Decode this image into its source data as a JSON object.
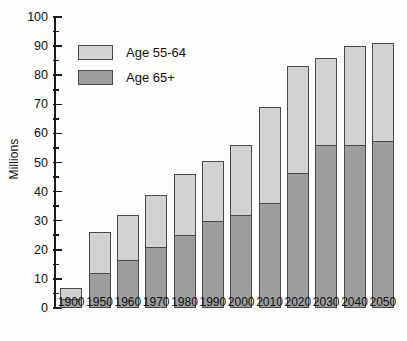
{
  "chart_data": {
    "type": "bar",
    "subtype": "stacked-bar",
    "title": "",
    "xlabel": "",
    "ylabel": "Millions",
    "ylim": [
      0,
      100
    ],
    "ytick_step": 10,
    "yminor_step": 5,
    "grid": false,
    "legend_position": "upper-left",
    "categories": [
      "1900",
      "1950",
      "1960",
      "1970",
      "1980",
      "1990",
      "2000",
      "2010",
      "2020",
      "2030",
      "2040",
      "2050"
    ],
    "ytick_labels": [
      "0",
      "10",
      "20",
      "30",
      "40",
      "50",
      "60",
      "70",
      "80",
      "90",
      "100"
    ],
    "series": [
      {
        "name": "Age 65+",
        "color": "#9e9e9e",
        "values": [
          3,
          12,
          16.5,
          21,
          25,
          30,
          32,
          36,
          46.5,
          56,
          56,
          57.5
        ]
      },
      {
        "name": "Age 55-64",
        "color": "#d2d2d2",
        "values": [
          4,
          14,
          15.5,
          18,
          21,
          20.5,
          24,
          33,
          36.5,
          30,
          34,
          33.5
        ]
      }
    ],
    "totals": [
      7,
      26,
      32,
      39,
      46,
      50.5,
      56,
      69,
      83,
      86,
      90,
      91
    ],
    "legend": [
      {
        "label": "Age 55-64",
        "color": "#d2d2d2"
      },
      {
        "label": "Age 65+",
        "color": "#9e9e9e"
      }
    ]
  },
  "axis": {
    "label": "Millions"
  }
}
